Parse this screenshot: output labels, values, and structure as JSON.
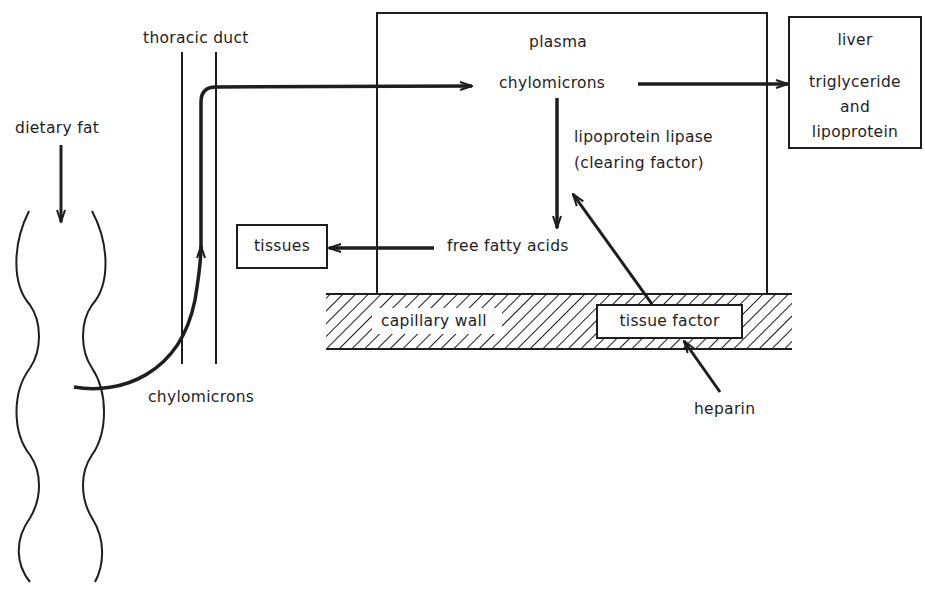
{
  "diagram": {
    "title": "",
    "labels": {
      "dietary_fat": "dietary fat",
      "thoracic_duct": "thoracic duct",
      "chylomicrons_lymph": "chylomicrons",
      "plasma": "plasma",
      "chylomicrons_plasma": "chylomicrons",
      "lipoprotein_lipase": "lipoprotein lipase",
      "clearing_factor": "(clearing factor)",
      "free_fatty_acids": "free fatty acids",
      "tissues": "tissues",
      "capillary_wall": "capillary wall",
      "tissue_factor": "tissue factor",
      "heparin": "heparin",
      "liver": "liver",
      "liver_line1": "triglyceride",
      "liver_line2": "and",
      "liver_line3": "lipoprotein"
    },
    "nodes": [
      {
        "id": "dietary_fat",
        "label": "dietary fat"
      },
      {
        "id": "intestine",
        "label": ""
      },
      {
        "id": "thoracic_duct",
        "label": "thoracic duct"
      },
      {
        "id": "plasma",
        "label": "plasma"
      },
      {
        "id": "chylomicrons",
        "label": "chylomicrons"
      },
      {
        "id": "liver",
        "label": "liver — triglyceride and lipoprotein"
      },
      {
        "id": "free_fatty_acids",
        "label": "free fatty acids"
      },
      {
        "id": "tissues",
        "label": "tissues"
      },
      {
        "id": "capillary_wall",
        "label": "capillary wall"
      },
      {
        "id": "tissue_factor",
        "label": "tissue factor"
      },
      {
        "id": "heparin",
        "label": "heparin"
      }
    ],
    "edges": [
      {
        "from": "dietary_fat",
        "to": "intestine"
      },
      {
        "from": "intestine",
        "to": "thoracic_duct",
        "label": "chylomicrons"
      },
      {
        "from": "thoracic_duct",
        "to": "chylomicrons"
      },
      {
        "from": "chylomicrons",
        "to": "liver"
      },
      {
        "from": "chylomicrons",
        "to": "free_fatty_acids",
        "label": "lipoprotein lipase (clearing factor)"
      },
      {
        "from": "free_fatty_acids",
        "to": "tissues"
      },
      {
        "from": "tissue_factor",
        "to": "lipoprotein_lipase"
      },
      {
        "from": "heparin",
        "to": "tissue_factor"
      }
    ],
    "colors": {
      "ink": "#1e1e1e",
      "background": "#ffffff"
    }
  }
}
